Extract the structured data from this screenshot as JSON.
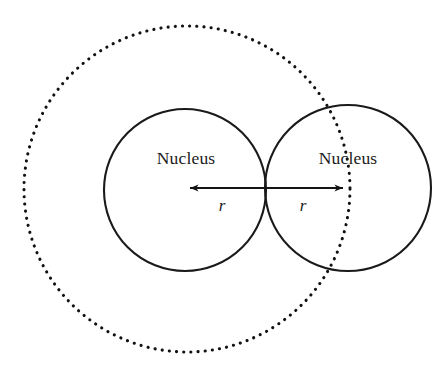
{
  "figure": {
    "background_color": "#ffffff",
    "stroke_color": "#1a1a1a",
    "dotted_stroke_color": "#111111",
    "text_color": "#1b1b1b",
    "width": 446,
    "height": 374
  },
  "labels": {
    "left_nucleus": "Nucleus",
    "right_nucleus": "Nucleus",
    "left_radius": "r",
    "right_radius": "r"
  },
  "geometry": {
    "left_circle": {
      "cx": 185,
      "cy": 190,
      "r": 81
    },
    "right_circle": {
      "cx": 348,
      "cy": 188,
      "r": 83
    },
    "dotted_circle": {
      "cx": 187,
      "cy": 189,
      "r": 163
    },
    "tangent_point_x": 266,
    "arrow_axis_y": 188,
    "left_arrow": {
      "x_start": 266,
      "x_end": 185
    },
    "right_arrow": {
      "x_start": 266,
      "x_end": 348
    }
  },
  "label_positions": {
    "left_nucleus": {
      "x": 186,
      "y": 164
    },
    "right_nucleus": {
      "x": 348,
      "y": 164
    },
    "left_radius": {
      "x": 222,
      "y": 210
    },
    "right_radius": {
      "x": 303,
      "y": 210
    }
  }
}
